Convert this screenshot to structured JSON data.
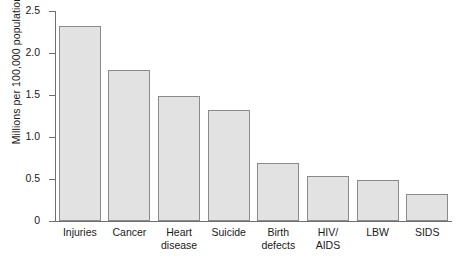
{
  "chart_data": {
    "type": "bar",
    "title": "",
    "xlabel": "",
    "ylabel": "Millions per 100,000 population",
    "ylim": [
      0,
      2.5
    ],
    "grid": false,
    "legend": "none",
    "y_ticks": [
      "0",
      "0.5",
      "1.0",
      "1.5",
      "2.0",
      "2.5"
    ],
    "y_tick_values": [
      0,
      0.5,
      1.0,
      1.5,
      2.0,
      2.5
    ],
    "categories": [
      "Injuries",
      "Cancer",
      "Heart\ndisease",
      "Suicide",
      "Birth\ndefects",
      "HIV/\nAIDS",
      "LBW",
      "SIDS"
    ],
    "values": [
      2.32,
      1.8,
      1.49,
      1.32,
      0.69,
      0.53,
      0.49,
      0.32
    ],
    "bar_fill_color": "#e2e2e2",
    "bar_border_color": "#8a8a8a",
    "axis_color": "#6f6f6f"
  }
}
